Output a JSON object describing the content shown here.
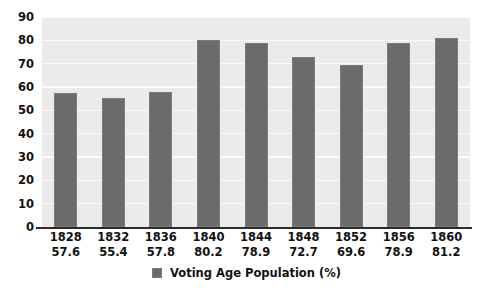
{
  "chart_data": {
    "type": "bar",
    "title": "",
    "xlabel": "",
    "ylabel": "",
    "ylim": [
      0,
      90
    ],
    "yticks": [
      90,
      80,
      70,
      60,
      50,
      40,
      30,
      20,
      10,
      0
    ],
    "grid": true,
    "legend_position": "bottom",
    "categories": [
      "1828",
      "1832",
      "1836",
      "1840",
      "1844",
      "1848",
      "1852",
      "1856",
      "1860"
    ],
    "values": [
      57.6,
      55.4,
      57.8,
      80.2,
      78.9,
      72.7,
      69.6,
      78.9,
      81.2
    ],
    "value_labels": [
      "57.6",
      "55.4",
      "57.8",
      "80.2",
      "78.9",
      "72.7",
      "69.6",
      "78.9",
      "81.2"
    ],
    "series": [
      {
        "name": "Voting Age Population (%)",
        "values": [
          57.6,
          55.4,
          57.8,
          80.2,
          78.9,
          72.7,
          69.6,
          78.9,
          81.2
        ]
      }
    ],
    "legend": [
      "Voting Age Population (%)"
    ]
  },
  "legend": {
    "label": "Voting Age Population (%)",
    "swatch_name": "legend-color-swatch"
  },
  "colors": {
    "bar_fill": "#6b6b6b",
    "bar_border": "#7b7b7b",
    "plot_background": "#ebebeb",
    "gridline": "#fbfbfb",
    "axis_line": "#2b2b2b",
    "text": "#111111",
    "page_background": "#ffffff"
  }
}
